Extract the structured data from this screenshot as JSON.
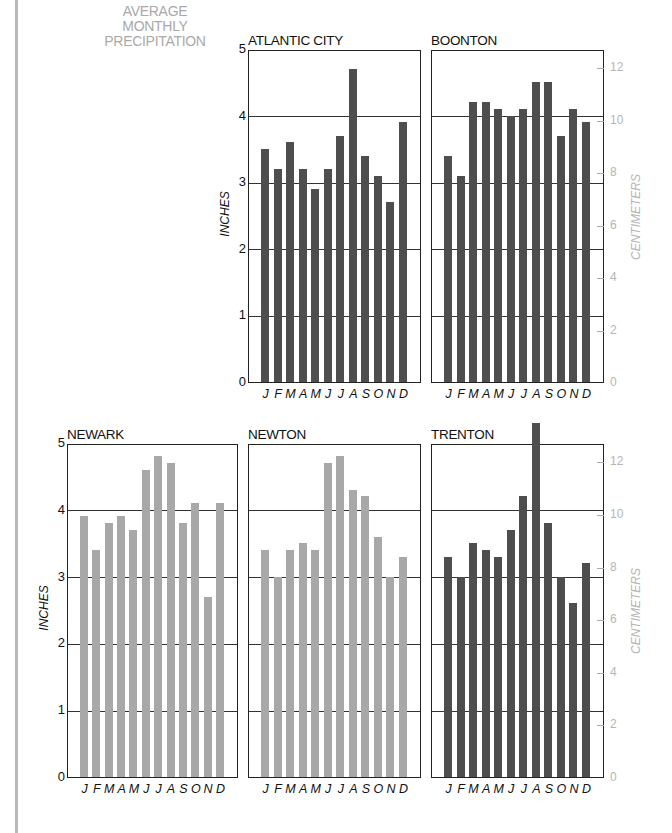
{
  "title_lines": [
    "AVERAGE",
    "MONTHLY",
    "PRECIPITATION"
  ],
  "colors": {
    "dark_bar": "#4e4e4e",
    "light_bar": "#a8a8a8",
    "title_gray": "#a9a9a9",
    "cm_gray": "#b5b5b5"
  },
  "axes": {
    "inches_label": "INCHES",
    "cm_label": "CENTIMETERS",
    "inch_ticks": [
      "0",
      "1",
      "2",
      "3",
      "4",
      "5"
    ],
    "cm_ticks": [
      "0",
      "2",
      "4",
      "6",
      "8",
      "10",
      "12"
    ],
    "months": [
      "J",
      "F",
      "M",
      "A",
      "M",
      "J",
      "J",
      "A",
      "S",
      "O",
      "N",
      "D"
    ]
  },
  "chart_data": [
    {
      "type": "bar",
      "title": "ATLANTIC CITY",
      "categories": [
        "J",
        "F",
        "M",
        "A",
        "M",
        "J",
        "J",
        "A",
        "S",
        "O",
        "N",
        "D"
      ],
      "values": [
        3.5,
        3.2,
        3.6,
        3.2,
        2.9,
        3.2,
        3.7,
        4.7,
        3.4,
        3.1,
        2.7,
        3.9
      ],
      "ylabel": "INCHES",
      "ylim": [
        0,
        5
      ],
      "grid": true,
      "bar_color": "#4e4e4e"
    },
    {
      "type": "bar",
      "title": "BOONTON",
      "categories": [
        "J",
        "F",
        "M",
        "A",
        "M",
        "J",
        "J",
        "A",
        "S",
        "O",
        "N",
        "D"
      ],
      "values": [
        3.4,
        3.1,
        4.2,
        4.2,
        4.1,
        4.0,
        4.1,
        4.5,
        4.5,
        3.7,
        4.1,
        3.9
      ],
      "ylabel_secondary": "CENTIMETERS",
      "ylim": [
        0,
        5
      ],
      "secondary_ylim_cm": [
        0,
        12.7
      ],
      "grid": true,
      "bar_color": "#4e4e4e"
    },
    {
      "type": "bar",
      "title": "NEWARK",
      "categories": [
        "J",
        "F",
        "M",
        "A",
        "M",
        "J",
        "J",
        "A",
        "S",
        "O",
        "N",
        "D"
      ],
      "values": [
        3.9,
        3.4,
        3.8,
        3.9,
        3.7,
        4.6,
        4.8,
        4.7,
        3.8,
        4.1,
        2.7,
        4.1
      ],
      "ylabel": "INCHES",
      "ylim": [
        0,
        5
      ],
      "grid": true,
      "bar_color": "#a8a8a8"
    },
    {
      "type": "bar",
      "title": "NEWTON",
      "categories": [
        "J",
        "F",
        "M",
        "A",
        "M",
        "J",
        "J",
        "A",
        "S",
        "O",
        "N",
        "D"
      ],
      "values": [
        3.4,
        3.0,
        3.4,
        3.5,
        3.4,
        4.7,
        4.8,
        4.3,
        4.2,
        3.6,
        3.0,
        3.3
      ],
      "ylim": [
        0,
        5
      ],
      "grid": true,
      "bar_color": "#a8a8a8"
    },
    {
      "type": "bar",
      "title": "TRENTON",
      "categories": [
        "J",
        "F",
        "M",
        "A",
        "M",
        "J",
        "J",
        "A",
        "S",
        "O",
        "N",
        "D"
      ],
      "values": [
        3.3,
        3.0,
        3.5,
        3.4,
        3.3,
        3.7,
        4.2,
        5.3,
        3.8,
        3.0,
        2.6,
        3.2
      ],
      "ylabel_secondary": "CENTIMETERS",
      "ylim": [
        0,
        5
      ],
      "secondary_ylim_cm": [
        0,
        12.7
      ],
      "grid": true,
      "bar_color": "#4e4e4e"
    }
  ]
}
